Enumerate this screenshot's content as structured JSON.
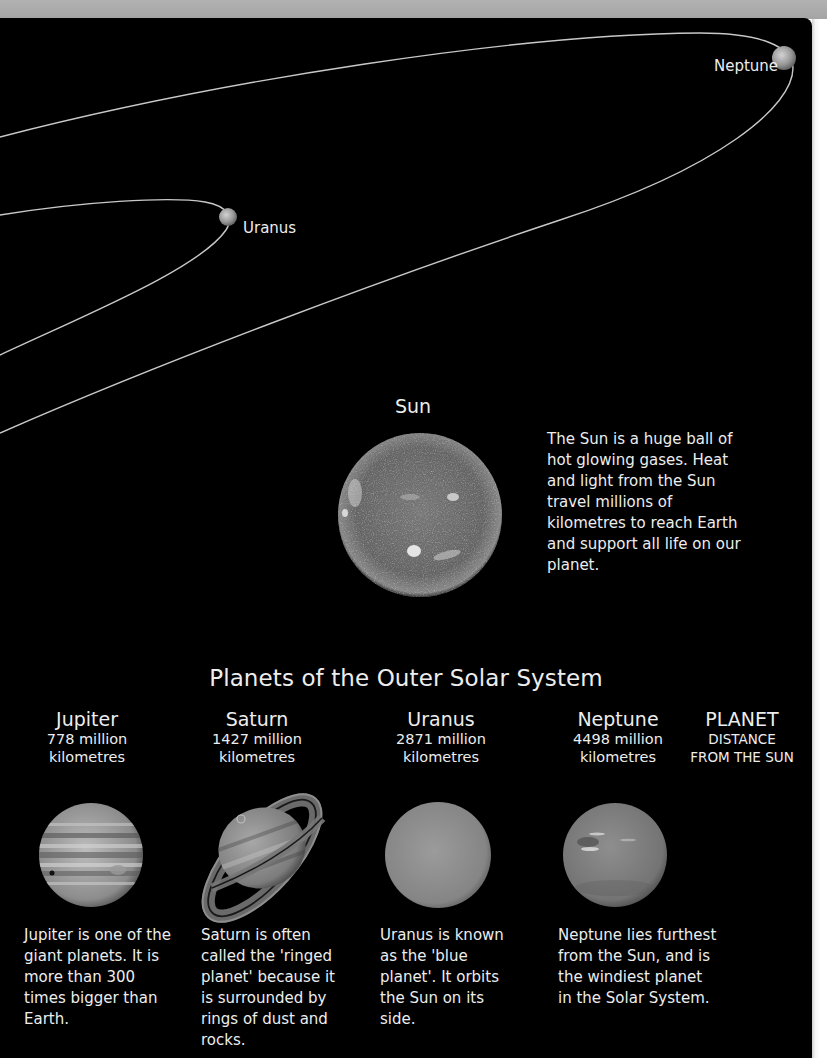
{
  "diagram": {
    "orbit_labels": {
      "neptune": "Neptune",
      "uranus": "Uranus"
    },
    "sun": {
      "label": "Sun",
      "description": "The Sun is a huge ball of hot glowing gases. Heat and light from the Sun travel millions of kilometres to reach Earth and support all life on our planet."
    }
  },
  "section": {
    "title": "Planets of the Outer Solar System",
    "legend": {
      "title": "PLANET",
      "line1": "DISTANCE",
      "line2": "FROM THE SUN"
    },
    "planets": [
      {
        "name": "Jupiter",
        "distance": "778 million",
        "unit": "kilometres",
        "description": "Jupiter is one of the giant planets. It is more than 300 times bigger than Earth."
      },
      {
        "name": "Saturn",
        "distance": "1427 million",
        "unit": "kilometres",
        "description": "Saturn is often called the 'ringed planet' because it is surrounded by rings of dust and rocks."
      },
      {
        "name": "Uranus",
        "distance": "2871 million",
        "unit": "kilometres",
        "description": "Uranus is known as the 'blue planet'. It orbits the Sun on its side."
      },
      {
        "name": "Neptune",
        "distance": "4498 million",
        "unit": "kilometres",
        "description": "Neptune lies furthest from the Sun, and is the windiest planet in the Solar System."
      }
    ]
  },
  "colors": {
    "page_background": "#ffffff",
    "panel_background": "#000000",
    "top_band": "#aaaaaa",
    "text": "#ededed",
    "orbit_line": "#c8c8c8"
  }
}
